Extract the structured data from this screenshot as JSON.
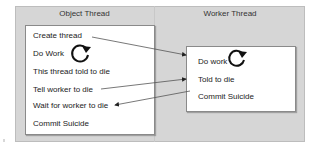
{
  "diagram": {
    "columns": [
      {
        "title": "Object Thread"
      },
      {
        "title": "Worker Thread"
      }
    ],
    "object_thread": {
      "items": [
        "Create thread",
        "Do Work",
        "This thread told to die",
        "Tell worker to die",
        "Wait for worker to die",
        "Commit Suicide"
      ]
    },
    "worker_thread": {
      "items": [
        "Do work",
        "Told to die",
        "Commit Suicide"
      ]
    },
    "arrows": [
      {
        "from": "Create thread",
        "to": "Do work"
      },
      {
        "from": "Tell worker to die",
        "to": "Told to die"
      },
      {
        "from": "Commit Suicide",
        "to": "Wait for worker to die"
      }
    ],
    "icons": [
      "loop-arrow-icon",
      "loop-arrow-icon"
    ],
    "colors": {
      "panel": "#d6d6d6",
      "box": "#ffffff",
      "text": "#222222",
      "line": "#555555"
    }
  }
}
